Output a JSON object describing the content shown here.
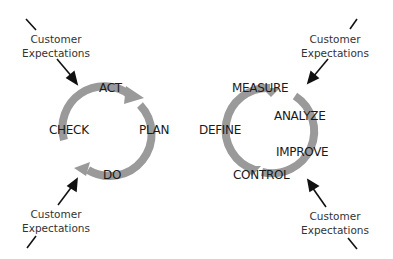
{
  "diagram": {
    "pdca": {
      "steps": [
        "ACT",
        "PLAN",
        "DO",
        "CHECK"
      ],
      "cycle_color": "#9a9a9a"
    },
    "dmaic": {
      "steps": [
        "MEASURE",
        "ANALYZE",
        "IMPROVE",
        "CONTROL",
        "DEFINE"
      ],
      "cycle_color": "#9a9a9a"
    },
    "customer": {
      "line1": "Customer",
      "line2": "Expectations"
    }
  }
}
